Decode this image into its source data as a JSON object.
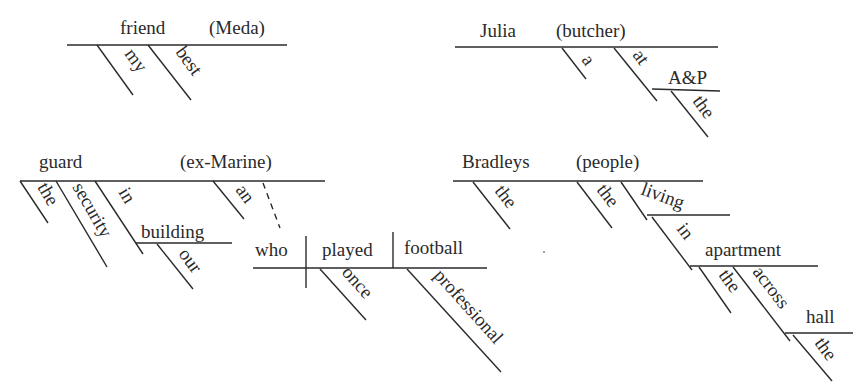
{
  "diagrams": [
    {
      "id": "meda",
      "baseline": {
        "subject": "friend",
        "appositive": "(Meda)"
      },
      "modifiers": [
        "my",
        "best"
      ]
    },
    {
      "id": "julia",
      "baseline": {
        "subject": "Julia",
        "appositive": "(butcher)"
      },
      "modifiers": [
        "a",
        "at",
        "A&P",
        "the"
      ]
    },
    {
      "id": "guard",
      "baseline": {
        "subject": "guard",
        "appositive": "(ex-Marine)"
      },
      "modifiers": [
        "the",
        "security",
        "in",
        "building",
        "our",
        "an"
      ],
      "relative_clause": {
        "subject": "who",
        "verb": "played",
        "object": "football",
        "modifiers": [
          "once",
          "professional"
        ]
      }
    },
    {
      "id": "bradleys",
      "baseline": {
        "subject": "Bradleys",
        "appositive": "(people)"
      },
      "modifiers": [
        "the",
        "the",
        "living",
        "in",
        "apartment",
        "the",
        "across",
        "hall",
        "the"
      ]
    }
  ]
}
